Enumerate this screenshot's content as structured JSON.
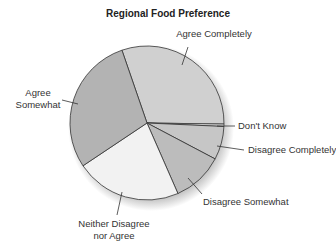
{
  "chart_data": {
    "type": "pie",
    "title": "Regional Food Preference",
    "categories": [
      "Agree Completely",
      "Don't Know",
      "Disagree Completely",
      "Disagree Somewhat",
      "Neither Disagree nor Agree",
      "Agree Somewhat"
    ],
    "values": [
      30.5,
      0.5,
      7,
      10.7,
      22.2,
      29.1
    ],
    "start_angle_deg": 341,
    "direction": "clockwise",
    "colors": [
      "#d0d0d0",
      "#e8e8e8",
      "#c6c6c6",
      "#bcbcbc",
      "#f2f2f2",
      "#b3b3b3"
    ],
    "labels": [
      {
        "lines": [
          "Agree Completely"
        ],
        "x": 214,
        "y": 37,
        "anchor": "middle",
        "lx1": 188,
        "ly1": 47,
        "lx2": 182,
        "ly2": 65
      },
      {
        "lines": [
          "Don't Know"
        ],
        "x": 238,
        "y": 129,
        "anchor": "start",
        "lx1": 217,
        "ly1": 126,
        "lx2": 235,
        "ly2": 126
      },
      {
        "lines": [
          "Disagree Completely"
        ],
        "x": 248,
        "y": 153,
        "anchor": "start",
        "lx1": 217,
        "ly1": 146,
        "lx2": 244,
        "ly2": 150
      },
      {
        "lines": [
          "Disagree Somewhat"
        ],
        "x": 203,
        "y": 205,
        "anchor": "start",
        "lx1": 188,
        "ly1": 178,
        "lx2": 202,
        "ly2": 194
      },
      {
        "lines": [
          "Neither Disagree",
          "nor Agree"
        ],
        "x": 114,
        "y": 227,
        "anchor": "middle",
        "lx1": 122,
        "ly1": 192,
        "lx2": 117,
        "ly2": 215
      },
      {
        "lines": [
          "Agree",
          "Somewhat"
        ],
        "x": 38,
        "y": 96,
        "anchor": "middle",
        "lx1": 62,
        "ly1": 100,
        "lx2": 78,
        "ly2": 104
      }
    ],
    "center": [
      147,
      123
    ],
    "radius": 77
  }
}
